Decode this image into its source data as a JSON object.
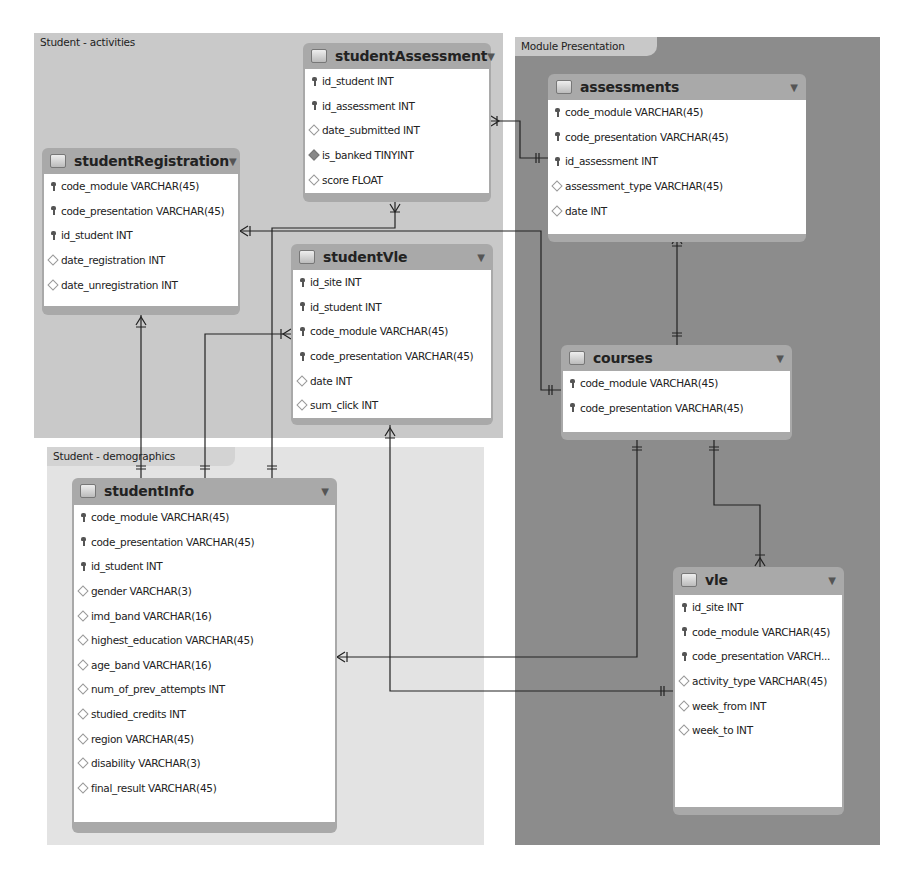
{
  "regions": {
    "activities": {
      "label": "Student - activities"
    },
    "demographics": {
      "label": "Student - demographics"
    },
    "module": {
      "label": "Module Presentation"
    }
  },
  "icons": {
    "table": "table-icon",
    "primary_key": "key-icon",
    "column": "diamond-icon",
    "column_not_null": "filled-diamond-icon",
    "toggle": "▼"
  },
  "colors": {
    "activities_bg": "#c9c9c9",
    "demographics_bg": "#e3e3e3",
    "module_bg": "#8c8c8c",
    "table_header": "#a9a9a9",
    "connector": "#222222"
  },
  "tables": {
    "studentAssessment": {
      "title": "studentAssessment",
      "columns": [
        {
          "name": "id_student INT",
          "kind": "pk"
        },
        {
          "name": "id_assessment INT",
          "kind": "pk"
        },
        {
          "name": "date_submitted INT",
          "kind": "col"
        },
        {
          "name": "is_banked TINYINT",
          "kind": "nn"
        },
        {
          "name": "score FLOAT",
          "kind": "col"
        }
      ]
    },
    "studentRegistration": {
      "title": "studentRegistration",
      "columns": [
        {
          "name": "code_module VARCHAR(45)",
          "kind": "pk"
        },
        {
          "name": "code_presentation VARCHAR(45)",
          "kind": "pk"
        },
        {
          "name": "id_student INT",
          "kind": "pk"
        },
        {
          "name": "date_registration INT",
          "kind": "col"
        },
        {
          "name": "date_unregistration INT",
          "kind": "col"
        }
      ]
    },
    "studentVle": {
      "title": "studentVle",
      "columns": [
        {
          "name": "id_site INT",
          "kind": "pk"
        },
        {
          "name": "id_student INT",
          "kind": "pk"
        },
        {
          "name": "code_module VARCHAR(45)",
          "kind": "pk"
        },
        {
          "name": "code_presentation VARCHAR(45)",
          "kind": "pk"
        },
        {
          "name": "date INT",
          "kind": "col"
        },
        {
          "name": "sum_click INT",
          "kind": "col"
        }
      ]
    },
    "assessments": {
      "title": "assessments",
      "columns": [
        {
          "name": "code_module VARCHAR(45)",
          "kind": "pk"
        },
        {
          "name": "code_presentation VARCHAR(45)",
          "kind": "pk"
        },
        {
          "name": "id_assessment INT",
          "kind": "pk"
        },
        {
          "name": "assessment_type VARCHAR(45)",
          "kind": "col"
        },
        {
          "name": "date INT",
          "kind": "col"
        }
      ]
    },
    "courses": {
      "title": "courses",
      "columns": [
        {
          "name": "code_module VARCHAR(45)",
          "kind": "pk"
        },
        {
          "name": "code_presentation VARCHAR(45)",
          "kind": "pk"
        }
      ]
    },
    "studentInfo": {
      "title": "studentInfo",
      "columns": [
        {
          "name": "code_module VARCHAR(45)",
          "kind": "pk"
        },
        {
          "name": "code_presentation VARCHAR(45)",
          "kind": "pk"
        },
        {
          "name": "id_student INT",
          "kind": "pk"
        },
        {
          "name": "gender VARCHAR(3)",
          "kind": "col"
        },
        {
          "name": "imd_band VARCHAR(16)",
          "kind": "col"
        },
        {
          "name": "highest_education VARCHAR(45)",
          "kind": "col"
        },
        {
          "name": "age_band VARCHAR(16)",
          "kind": "col"
        },
        {
          "name": "num_of_prev_attempts INT",
          "kind": "col"
        },
        {
          "name": "studied_credits INT",
          "kind": "col"
        },
        {
          "name": "region VARCHAR(45)",
          "kind": "col"
        },
        {
          "name": "disability VARCHAR(3)",
          "kind": "col"
        },
        {
          "name": "final_result VARCHAR(45)",
          "kind": "col"
        }
      ]
    },
    "vle": {
      "title": "vle",
      "columns": [
        {
          "name": "id_site INT",
          "kind": "pk"
        },
        {
          "name": "code_module VARCHAR(45)",
          "kind": "pk"
        },
        {
          "name": "code_presentation VARCH...",
          "kind": "pk"
        },
        {
          "name": "activity_type VARCHAR(45)",
          "kind": "col"
        },
        {
          "name": "week_from INT",
          "kind": "col"
        },
        {
          "name": "week_to INT",
          "kind": "col"
        }
      ]
    }
  }
}
